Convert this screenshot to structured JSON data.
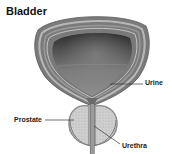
{
  "diagram": {
    "title": "Bladder",
    "labels": {
      "urine": "Urine",
      "prostate": "Prostate",
      "urethra": "Urethra"
    },
    "colors": {
      "outer_wall": "#7a7a7a",
      "wall_stripe_light": "#b8b8b8",
      "wall_stripe_mid": "#9a9a9a",
      "cavity_top": "#3a3a3a",
      "cavity_mid": "#6e6e6e",
      "cavity_bottom": "#8c8c8c",
      "prostate_fill": "#c9c9c9",
      "prostate_edge": "#8a8a8a",
      "urethra": "#6a6a6a",
      "leader_line": "#333333",
      "text": "#222222"
    }
  }
}
